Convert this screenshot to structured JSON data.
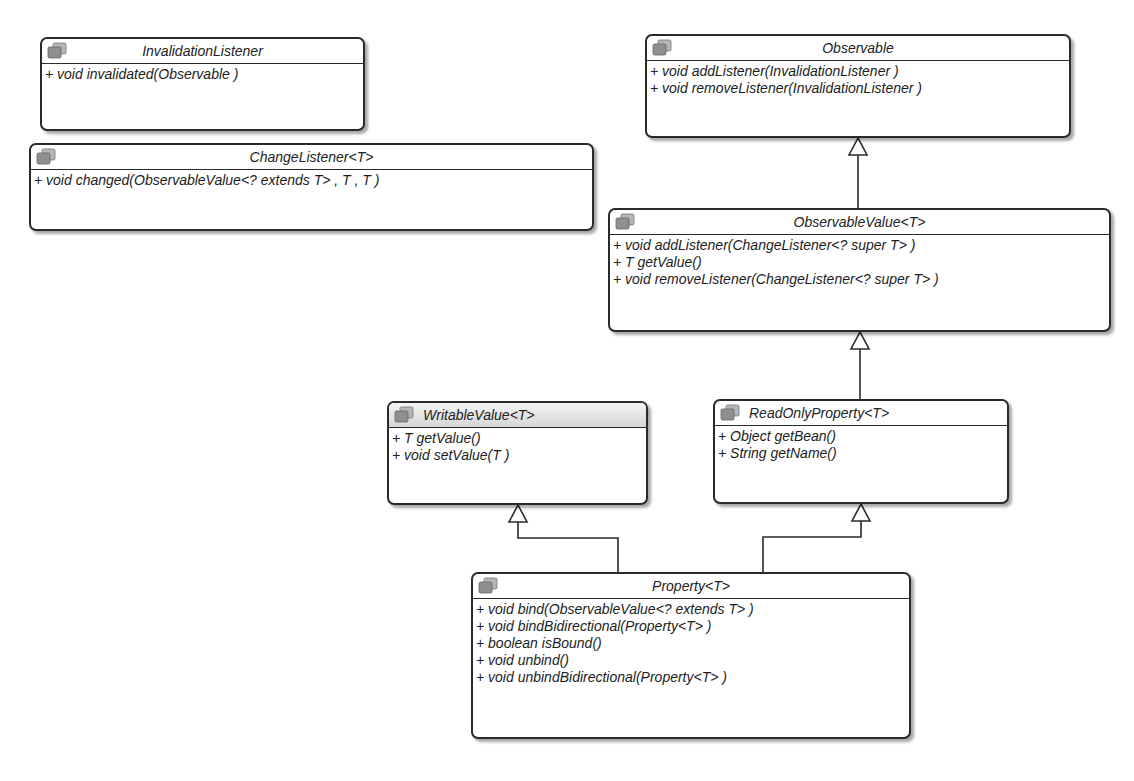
{
  "diagram": {
    "type": "UML class diagram",
    "classes": [
      {
        "id": "InvalidationListener",
        "name": "InvalidationListener",
        "icon": "interface-icon",
        "operations": [
          "+ void invalidated(Observable )"
        ]
      },
      {
        "id": "ChangeListener",
        "name": "ChangeListener<T>",
        "icon": "interface-icon",
        "operations": [
          "+ void changed(ObservableValue<? extends T> , T , T )"
        ]
      },
      {
        "id": "Observable",
        "name": "Observable",
        "icon": "interface-icon",
        "operations": [
          "+ void addListener(InvalidationListener )",
          "+ void removeListener(InvalidationListener )"
        ]
      },
      {
        "id": "ObservableValue",
        "name": "ObservableValue<T>",
        "icon": "interface-icon",
        "operations": [
          "+ void addListener(ChangeListener<? super T> )",
          "+ T getValue()",
          "+ void removeListener(ChangeListener<? super T> )"
        ]
      },
      {
        "id": "WritableValue",
        "name": "WritableValue<T>",
        "icon": "interface-icon",
        "operations": [
          "+ T getValue()",
          "+ void setValue(T )"
        ]
      },
      {
        "id": "ReadOnlyProperty",
        "name": "ReadOnlyProperty<T>",
        "icon": "interface-icon",
        "operations": [
          "+ Object getBean()",
          "+ String getName()"
        ]
      },
      {
        "id": "Property",
        "name": "Property<T>",
        "icon": "interface-icon",
        "operations": [
          "+ void bind(ObservableValue<? extends T> )",
          "+ void bindBidirectional(Property<T> )",
          "+ boolean isBound()",
          "+ void unbind()",
          "+ void unbindBidirectional(Property<T> )"
        ]
      }
    ],
    "relations": [
      {
        "from": "ObservableValue",
        "to": "Observable",
        "kind": "generalization"
      },
      {
        "from": "ReadOnlyProperty",
        "to": "ObservableValue",
        "kind": "generalization"
      },
      {
        "from": "Property",
        "to": "WritableValue",
        "kind": "generalization"
      },
      {
        "from": "Property",
        "to": "ReadOnlyProperty",
        "kind": "generalization"
      }
    ]
  },
  "colors": {
    "border": "#2a2a2a",
    "background": "#ffffff",
    "header_gradient_top": "#f4f4f4",
    "header_gradient_bottom": "#d6d6d6",
    "icon_fill": "#9a9a9a"
  }
}
